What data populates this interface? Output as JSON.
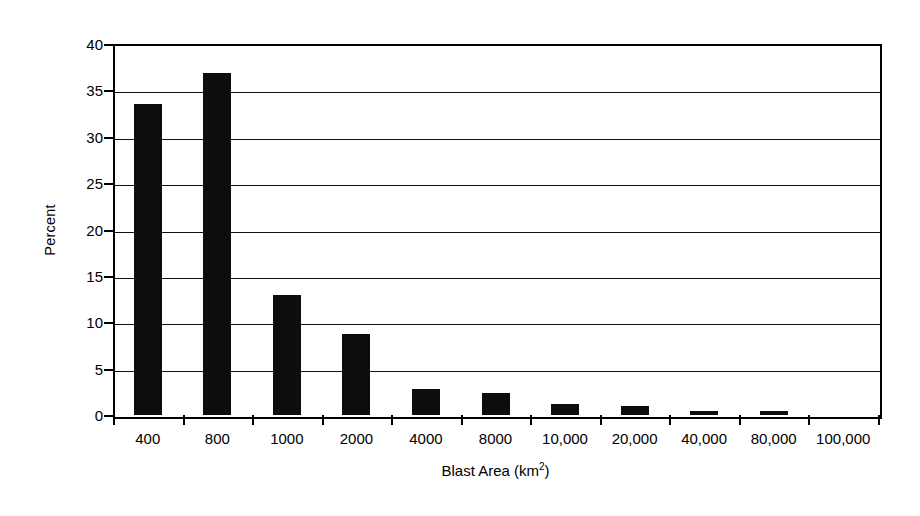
{
  "chart_data": {
    "type": "bar",
    "title": "",
    "subtitle": "",
    "xlabel": "Blast Area (km2)",
    "xlabel_base": "Blast Area (km",
    "xlabel_exponent": "2",
    "xlabel_close": ")",
    "ylabel": "Percent",
    "ylim": [
      0,
      40
    ],
    "ytick_step": 5,
    "yticks": [
      0,
      5,
      10,
      15,
      20,
      25,
      30,
      35,
      40
    ],
    "ytick_labels": [
      "0",
      "5",
      "10",
      "15",
      "20",
      "25",
      "30",
      "35",
      "40"
    ],
    "grid": true,
    "grid_axis": "y",
    "legend": "none",
    "categories": [
      "400",
      "800",
      "1000",
      "2000",
      "4000",
      "8000",
      "10,000",
      "20,000",
      "40,000",
      "80,000",
      "100,000"
    ],
    "values": [
      33.5,
      36.9,
      12.9,
      8.7,
      2.8,
      2.4,
      1.2,
      1.0,
      0.4,
      0.4,
      0.0
    ],
    "bar_color": "#0d0d0d",
    "background_color": "#ffffff",
    "axis_color": "#000000"
  }
}
